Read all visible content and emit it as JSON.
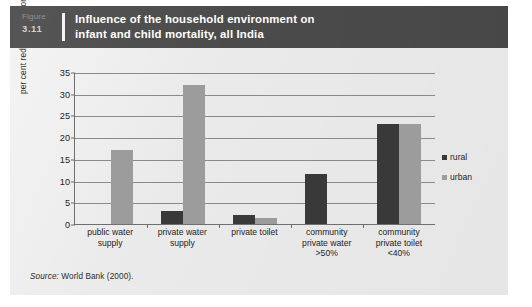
{
  "figure": {
    "number_word": "Figure",
    "number": "3.11",
    "title_line1": "Influence of the household environment on",
    "title_line2": "infant and child mortality, all India",
    "source_label": "Source:",
    "source_text": "World Bank (2000).",
    "header_color": "#4c4b4b",
    "panel_color": "#ebeaea"
  },
  "chart_data": {
    "type": "bar",
    "title": "Influence of the household environment on infant and child mortality, all India",
    "subtitle": "",
    "xlabel": "",
    "ylabel": "per cent reduction in mortality",
    "ylim": [
      0,
      35
    ],
    "ytick_step": 5,
    "yticks": [
      "0",
      "5",
      "10",
      "15",
      "20",
      "25",
      "30",
      "35"
    ],
    "grid": true,
    "legend_position": "right",
    "categories": [
      "public water supply",
      "private water supply",
      "private toilet",
      "community private water >50%",
      "community private toilet <40%"
    ],
    "category_lines": [
      [
        "public water",
        "supply"
      ],
      [
        "private water",
        "supply"
      ],
      [
        "private toilet"
      ],
      [
        "community",
        "private water",
        ">50%"
      ],
      [
        "community",
        "private toilet",
        "<40%"
      ]
    ],
    "series": [
      {
        "name": "rural",
        "color": "#3a3939",
        "values": [
          0,
          3,
          2,
          11.5,
          23
        ]
      },
      {
        "name": "urban",
        "color": "#9d9c9c",
        "values": [
          17,
          32,
          1.5,
          0,
          23
        ]
      }
    ]
  }
}
